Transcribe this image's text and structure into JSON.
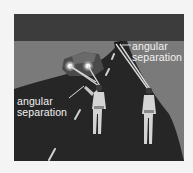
{
  "figure": {
    "labels": {
      "upper_right": [
        "angular",
        "separation"
      ],
      "lower_left": [
        "angular",
        "separation"
      ]
    },
    "colors": {
      "sky_band": "#3c3c3c",
      "background": "#7c7c7c",
      "road": "#2a2a2a",
      "label_text": "#f2f2f2",
      "sight_lines": "#d8d8d8",
      "page": "#f4f4f4"
    }
  }
}
